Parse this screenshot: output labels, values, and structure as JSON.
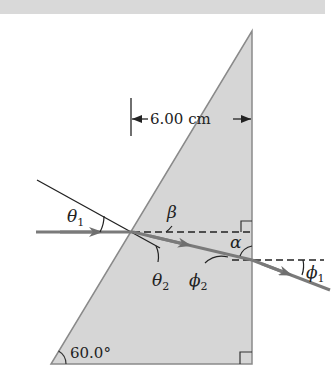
{
  "figure": {
    "dimension_label": "6.00 cm",
    "prism_angle_label": "60.0°",
    "angles": {
      "theta1": {
        "symbol": "θ",
        "sub": "1"
      },
      "theta2": {
        "symbol": "θ",
        "sub": "2"
      },
      "phi1": {
        "symbol": "ϕ",
        "sub": "1"
      },
      "phi2": {
        "symbol": "ϕ",
        "sub": "2"
      },
      "alpha": {
        "symbol": "α"
      },
      "beta": {
        "symbol": "β"
      }
    },
    "colors": {
      "prism_fill": "#d6d6d6",
      "prism_edge": "#8a8a8a",
      "ray": "#7a7a7a",
      "line": "#222222",
      "top_band": "#d9d9d9"
    }
  }
}
